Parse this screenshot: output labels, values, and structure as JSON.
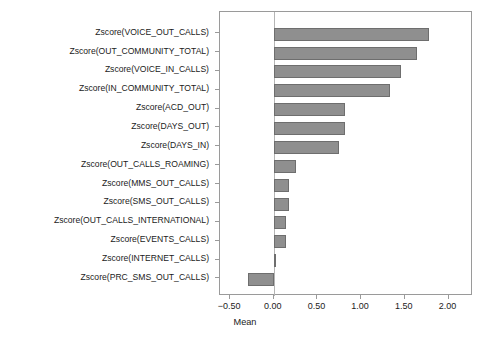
{
  "chart_data": {
    "type": "bar",
    "orientation": "horizontal",
    "title": "",
    "xlabel": "Mean",
    "ylabel": "",
    "xlim": [
      -0.615,
      2.28
    ],
    "xticks": [
      -0.5,
      0.0,
      0.5,
      1.0,
      1.5,
      2.0
    ],
    "xtick_labels": [
      "-0.50",
      "0.00",
      "0.50",
      "1.00",
      "1.50",
      "2.00"
    ],
    "grid": false,
    "legend": "none",
    "bar_color": "#8f8f8f",
    "bar_edge_color": "#6e6e6e",
    "categories": [
      "Zscore(VOICE_OUT_CALLS)",
      "Zscore(OUT_COMMUNITY_TOTAL)",
      "Zscore(VOICE_IN_CALLS)",
      "Zscore(IN_COMMUNITY_TOTAL)",
      "Zscore(ACD_OUT)",
      "Zscore(DAYS_OUT)",
      "Zscore(DAYS_IN)",
      "Zscore(OUT_CALLS_ROAMING)",
      "Zscore(MMS_OUT_CALLS)",
      "Zscore(SMS_OUT_CALLS)",
      "Zscore(OUT_CALLS_INTERNATIONAL)",
      "Zscore(EVENTS_CALLS)",
      "Zscore(INTERNET_CALLS)",
      "Zscore(PRC_SMS_OUT_CALLS)"
    ],
    "values": [
      1.78,
      1.64,
      1.46,
      1.33,
      0.82,
      0.82,
      0.75,
      0.26,
      0.18,
      0.18,
      0.14,
      0.14,
      0.03,
      -0.29
    ]
  }
}
